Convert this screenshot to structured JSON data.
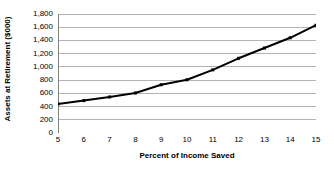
{
  "chart_data": {
    "type": "line",
    "title": "",
    "xlabel": "Percent of Income Saved",
    "ylabel": "Assets at Retirement ($000)",
    "x": [
      5,
      6,
      7,
      8,
      9,
      10,
      11,
      12,
      13,
      14,
      15
    ],
    "values": [
      440,
      490,
      545,
      605,
      730,
      805,
      955,
      1130,
      1285,
      1440,
      1630
    ],
    "series": [
      {
        "name": "Assets at Retirement",
        "values": [
          440,
          490,
          545,
          605,
          730,
          805,
          955,
          1130,
          1285,
          1440,
          1630
        ]
      }
    ],
    "xlim": [
      5,
      15
    ],
    "ylim": [
      0,
      1800
    ],
    "xticks": [
      5,
      6,
      7,
      8,
      9,
      10,
      11,
      12,
      13,
      14,
      15
    ],
    "xtick_labels": [
      "5",
      "6",
      "7",
      "8",
      "9",
      "10",
      "11",
      "12",
      "13",
      "14",
      "15"
    ],
    "yticks": [
      0,
      200,
      400,
      600,
      800,
      1000,
      1200,
      1400,
      1600,
      1800
    ],
    "ytick_labels": [
      "0",
      "200",
      "400",
      "600",
      "800",
      "1,000",
      "1,200",
      "1,400",
      "1,600",
      "1,800"
    ],
    "grid": "horizontal",
    "legend": "none",
    "colors": {
      "line": "#000000",
      "marker": "#000000",
      "gridline": "#b4b4b4",
      "axis": "#808080",
      "background": "#ffffff"
    },
    "marker": "square",
    "line_width": 2
  }
}
